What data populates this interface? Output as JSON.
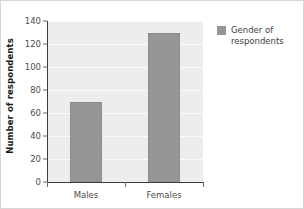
{
  "chart_data": {
    "type": "bar",
    "title": "",
    "xlabel": "",
    "ylabel": "Number of respondents",
    "categories": [
      "Males",
      "Females"
    ],
    "values": [
      70,
      130
    ],
    "series": [
      {
        "name": "Gender of respondents",
        "values": [
          70,
          130
        ],
        "color": "#969696"
      }
    ],
    "ylim": [
      0,
      140
    ],
    "yticks": [
      0,
      20,
      40,
      60,
      80,
      100,
      120,
      140
    ],
    "ytick_labels": [
      "0",
      "20",
      "40",
      "60",
      "80",
      "100",
      "120",
      "140"
    ],
    "grid": true,
    "grid_axis": "y",
    "legend": {
      "position": "right",
      "entries": [
        {
          "label": "Gender of respondents",
          "color": "#969696"
        }
      ]
    },
    "plot_background": "#ededed",
    "gridline_color": "#fbfbfb",
    "axis_color": "#3d3d3d"
  }
}
